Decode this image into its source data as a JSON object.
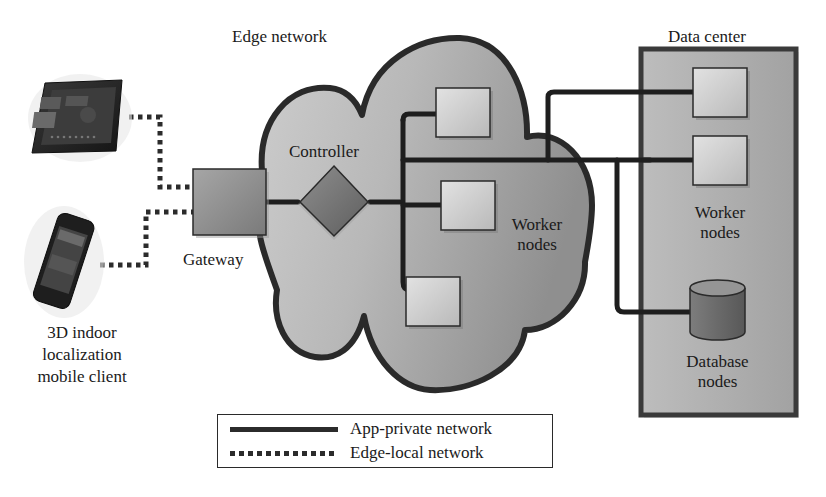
{
  "diagram": {
    "title_edge": "Edge network",
    "title_datacenter": "Data center",
    "labels": {
      "controller": "Controller",
      "gateway": "Gateway",
      "edge_workers_line1": "Worker",
      "edge_workers_line2": "nodes",
      "dc_workers_line1": "Worker",
      "dc_workers_line2": "nodes",
      "db_line1": "Database",
      "db_line2": "nodes",
      "client_line1": "3D indoor",
      "client_line2": "localization",
      "client_line3": "mobile client"
    },
    "icons": {
      "tablet": "tablet-device-icon",
      "phone": "smartphone-device-icon",
      "database": "database-cylinder-icon",
      "controller": "diamond-controller-icon"
    },
    "colors": {
      "outline": "#2a2a2a",
      "cloud_fill_light": "#c9c9c9",
      "cloud_fill_dark": "#9a9a9a",
      "node_fill": "#cfcfcf",
      "gateway_fill": "#8e8e8e",
      "datacenter_fill": "#a8a8a8"
    }
  },
  "legend": {
    "items": [
      {
        "style": "solid",
        "label": "App-private network"
      },
      {
        "style": "dotted",
        "label": "Edge-local network"
      }
    ]
  }
}
